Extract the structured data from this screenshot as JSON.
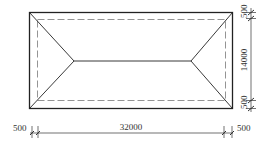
{
  "diagram": {
    "type": "hip-roof-plan",
    "dimensions": {
      "top_overhang": "500",
      "height": "14000",
      "bottom_overhang": "500",
      "left_overhang": "500",
      "length": "32000",
      "right_overhang": "500"
    },
    "colors": {
      "line": "#222222",
      "dash": "#777777"
    }
  }
}
